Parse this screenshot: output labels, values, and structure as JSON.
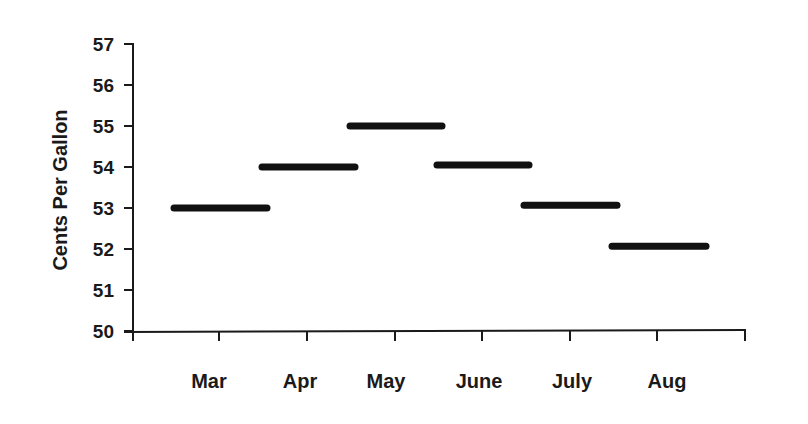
{
  "chart_data": {
    "type": "line",
    "style": "horizontal-step-segments",
    "title": "",
    "xlabel": "",
    "ylabel": "Cents Per Gallon",
    "categories": [
      "Mar",
      "Apr",
      "May",
      "June",
      "July",
      "Aug"
    ],
    "values": [
      53,
      54,
      55,
      54.05,
      53.07,
      52.07
    ],
    "ylim": [
      50,
      57
    ],
    "yticks": [
      50,
      51,
      52,
      53,
      54,
      55,
      56,
      57
    ],
    "grid": false,
    "legend": null,
    "series_color": "#111111"
  },
  "labels": {
    "ylabel": "Cents Per Gallon",
    "yticks": [
      "50",
      "51",
      "52",
      "53",
      "54",
      "55",
      "56",
      "57"
    ],
    "categories": [
      "Mar",
      "Apr",
      "May",
      "June",
      "July",
      "Aug"
    ]
  }
}
